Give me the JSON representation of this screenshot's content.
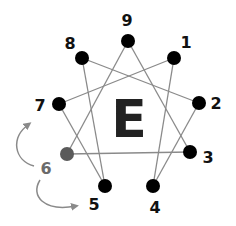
{
  "diagram": {
    "center_letter": "E",
    "colors": {
      "node": "#000000",
      "highlight_node": "#5a5a5a",
      "line": "#8a8a8a",
      "label": "#111111",
      "highlight_label": "#6a6a6a",
      "arrow": "#8a8a8a"
    },
    "nodes": [
      {
        "id": "9",
        "label": "9",
        "x": 128,
        "y": 41,
        "lx": 127,
        "ly": 26
      },
      {
        "id": "1",
        "label": "1",
        "x": 174,
        "y": 58,
        "lx": 186,
        "ly": 48
      },
      {
        "id": "2",
        "label": "2",
        "x": 199,
        "y": 103,
        "lx": 216,
        "ly": 109
      },
      {
        "id": "3",
        "label": "3",
        "x": 190,
        "y": 152,
        "lx": 208,
        "ly": 163
      },
      {
        "id": "4",
        "label": "4",
        "x": 153,
        "y": 186,
        "lx": 155,
        "ly": 213
      },
      {
        "id": "5",
        "label": "5",
        "x": 105,
        "y": 186,
        "lx": 94,
        "ly": 210
      },
      {
        "id": "6",
        "label": "6",
        "x": 67,
        "y": 154,
        "lx": 46,
        "ly": 174,
        "highlight": true
      },
      {
        "id": "7",
        "label": "7",
        "x": 59,
        "y": 104,
        "lx": 40,
        "ly": 111
      },
      {
        "id": "8",
        "label": "8",
        "x": 82,
        "y": 58,
        "lx": 70,
        "ly": 49
      }
    ],
    "edges": [
      [
        "9",
        "3"
      ],
      [
        "3",
        "6"
      ],
      [
        "6",
        "9"
      ],
      [
        "1",
        "4"
      ],
      [
        "4",
        "2"
      ],
      [
        "2",
        "8"
      ],
      [
        "8",
        "5"
      ],
      [
        "5",
        "7"
      ],
      [
        "7",
        "1"
      ]
    ],
    "arrows": [
      {
        "from": "6",
        "to": "7",
        "direction": "up"
      },
      {
        "from": "6",
        "to": "5",
        "direction": "down"
      }
    ]
  }
}
